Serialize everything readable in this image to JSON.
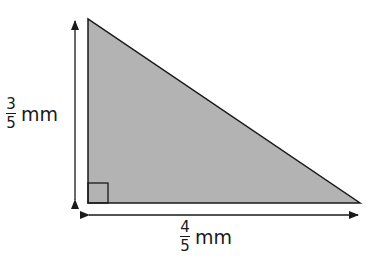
{
  "diagram": {
    "type": "right-triangle",
    "fill_color": "#b3b3b3",
    "stroke_color": "#1a1a1a",
    "vertical_side": {
      "numerator": "3",
      "denominator": "5",
      "unit": "mm"
    },
    "horizontal_side": {
      "numerator": "4",
      "denominator": "5",
      "unit": "mm"
    },
    "right_angle_marker": true
  }
}
